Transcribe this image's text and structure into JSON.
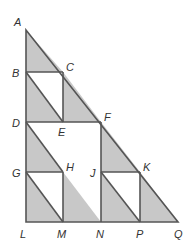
{
  "diagram": {
    "colors": {
      "stroke": "#555555",
      "shade": "#c8c8c8",
      "background": "#ffffff",
      "label": "#333333"
    },
    "points": {
      "A": "A",
      "B": "B",
      "C": "C",
      "D": "D",
      "E": "E",
      "F": "F",
      "G": "G",
      "H": "H",
      "J": "J",
      "K": "K",
      "L": "L",
      "M": "M",
      "N": "N",
      "P": "P",
      "Q": "Q"
    }
  }
}
